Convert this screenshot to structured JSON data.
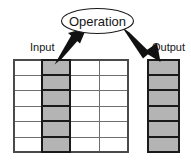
{
  "diagram": {
    "operation_node": {
      "label": "Operation",
      "shape": "ellipse",
      "cx": 97.5,
      "cy": 21,
      "rx": 36,
      "ry": 12.5,
      "stroke": "#1a1a1a",
      "fill": "#ffffff"
    },
    "labels": {
      "input": "Input",
      "output": "Output"
    },
    "arrows": [
      {
        "name": "input-to-operation-arrow",
        "from": [
          57,
          63
        ],
        "to": [
          85,
          33
        ],
        "color": "#111111",
        "direction": "up-right"
      },
      {
        "name": "operation-to-output-arrow",
        "from": [
          124,
          30
        ],
        "to": [
          158,
          61
        ],
        "color": "#111111",
        "direction": "down-right"
      }
    ],
    "input_table": {
      "name": "input-table",
      "x": 14,
      "y": 60,
      "width": 114,
      "height": 92,
      "columns": 4,
      "rows": 6,
      "highlighted_column_index": 1,
      "column_edges": [
        14,
        42,
        70,
        99,
        128
      ],
      "row_edges": [
        60,
        75,
        90,
        106,
        121,
        137,
        152
      ],
      "grid_stroke": "#6e6e6e",
      "outer_stroke": "#3a3a3a",
      "highlight_fill": "#b4b4b4",
      "highlight_stroke": "#1a1a1a",
      "cell_fill": "#ffffff",
      "cells": [
        [
          "",
          "",
          "",
          ""
        ],
        [
          "",
          "",
          "",
          ""
        ],
        [
          "",
          "",
          "",
          ""
        ],
        [
          "",
          "",
          "",
          ""
        ],
        [
          "",
          "",
          "",
          ""
        ],
        [
          "",
          "",
          "",
          ""
        ]
      ]
    },
    "output_table": {
      "name": "output-table",
      "x": 148,
      "y": 60,
      "width": 31,
      "height": 92,
      "columns": 1,
      "rows": 6,
      "row_edges": [
        60,
        75,
        90,
        106,
        121,
        137,
        152
      ],
      "outer_stroke": "#1a1a1a",
      "cell_stroke": "#1a1a1a",
      "highlight_fill": "#b4b4b4",
      "cells": [
        "",
        "",
        "",
        "",
        "",
        ""
      ]
    },
    "colors": {
      "shaded_cell": "#b4b4b4",
      "grid_line": "#6e6e6e",
      "dark_line": "#1a1a1a",
      "text": "#151515",
      "background": "#ffffff"
    }
  }
}
